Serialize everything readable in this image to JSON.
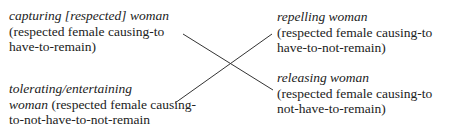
{
  "nodes": {
    "top_left": {
      "title": "capturing [respected] woman",
      "line2": "(respected female causing-to",
      "line3": "have-to-remain)"
    },
    "bottom_left": {
      "title": "tolerating/entertaining",
      "title2": "woman",
      "line2_rest": " (respected female causing-",
      "line3": "to-not-have-to-not-remain"
    },
    "top_right": {
      "title": "repelling woman",
      "line2": "(respected female causing-to",
      "line3": "have-to-not-remain)"
    },
    "bottom_right": {
      "title": "releasing woman",
      "line2": "(respected female causing-to",
      "line3": "not-have-to-remain)"
    }
  },
  "edges": [
    {
      "from": "top_left",
      "to": "bottom_right"
    },
    {
      "from": "bottom_left",
      "to": "top_right"
    }
  ]
}
